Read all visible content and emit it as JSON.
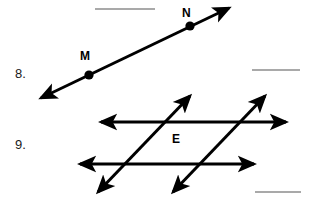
{
  "page": {
    "background_color": "#ffffff",
    "ink_color": "#000000",
    "blank_line_color": "#888888",
    "width": 316,
    "height": 198
  },
  "questions": [
    {
      "number_label": "8.",
      "figure_type": "line-through-two-points",
      "point_labels": [
        "M",
        "N"
      ],
      "answer_blank": true
    },
    {
      "number_label": "9.",
      "figure_type": "two-parallel-lines-with-two-transversals",
      "point_labels": [
        "E"
      ],
      "answer_blank": true
    }
  ],
  "labels": {
    "q8_number": "8.",
    "q9_number": "9.",
    "point_m": "M",
    "point_n": "N",
    "plane_e": "E"
  },
  "answer_blanks": [
    {
      "name": "top-blank",
      "x": 95,
      "y": 9,
      "width": 60
    },
    {
      "name": "q8-blank",
      "x": 252,
      "y": 70,
      "width": 48
    },
    {
      "name": "q9-blank",
      "x": 255,
      "y": 192,
      "width": 46
    }
  ],
  "figures": {
    "q8": {
      "line": {
        "x1": 40,
        "y1": 99,
        "x2": 230,
        "y2": 7
      },
      "arrowheads": [
        "start",
        "end"
      ],
      "points": [
        {
          "label": "M",
          "x": 89,
          "y": 75
        },
        {
          "label": "N",
          "x": 190,
          "y": 26
        }
      ]
    },
    "q9": {
      "horizontal_lines": [
        {
          "x1": 99,
          "y1": 122,
          "x2": 288,
          "y2": 122,
          "arrowheads": [
            "start",
            "end"
          ]
        },
        {
          "x1": 78,
          "y1": 164,
          "x2": 256,
          "y2": 164,
          "arrowheads": [
            "start",
            "end"
          ]
        }
      ],
      "transversals": [
        {
          "x1": 97,
          "y1": 194,
          "x2": 191,
          "y2": 94,
          "arrowheads": [
            "start",
            "end"
          ]
        },
        {
          "x1": 172,
          "y1": 194,
          "x2": 266,
          "y2": 94,
          "arrowheads": [
            "start",
            "end"
          ]
        }
      ],
      "plane_label": {
        "label": "E",
        "x": 176,
        "y": 140
      }
    }
  }
}
